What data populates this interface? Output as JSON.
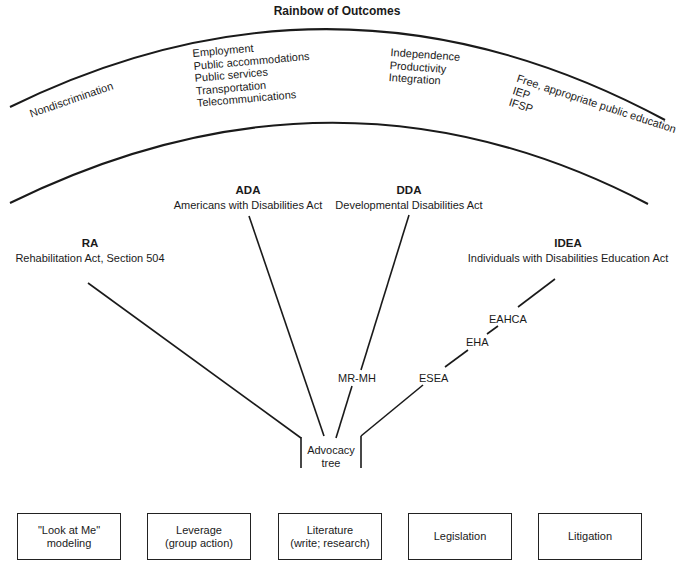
{
  "title": "Rainbow of Outcomes",
  "rainbow": {
    "segments": [
      {
        "id": "nondiscrimination",
        "lines": [
          "Nondiscrimination"
        ]
      },
      {
        "id": "ada-outcomes",
        "lines": [
          "Employment",
          "Public accommodations",
          "Public services",
          "Transportation",
          "Telecommunications"
        ]
      },
      {
        "id": "dda-outcomes",
        "lines": [
          "Independence",
          "Productivity",
          "Integration"
        ]
      },
      {
        "id": "idea-outcomes",
        "lines": [
          "Free, appropriate public education",
          "IEP",
          "IFSP"
        ]
      }
    ]
  },
  "acts": [
    {
      "abbr": "RA",
      "name": "Rehabilitation Act, Section 504"
    },
    {
      "abbr": "ADA",
      "name": "Americans with Disabilities Act"
    },
    {
      "abbr": "DDA",
      "name": "Developmental Disabilities Act"
    },
    {
      "abbr": "IDEA",
      "name": "Individuals with Disabilities Education Act"
    }
  ],
  "branch_labels": {
    "dda_precursor": "MR-MH",
    "idea_precursors": [
      "EAHCA",
      "EHA",
      "ESEA"
    ]
  },
  "trunk": {
    "lines": [
      "Advocacy",
      "tree"
    ]
  },
  "strategies": [
    {
      "lines": [
        "\"Look at Me\"",
        "modeling"
      ]
    },
    {
      "lines": [
        "Leverage",
        "(group action)"
      ]
    },
    {
      "lines": [
        "Literature",
        "(write; research)"
      ]
    },
    {
      "lines": [
        "Legislation"
      ]
    },
    {
      "lines": [
        "Litigation"
      ]
    }
  ],
  "colors": {
    "ink": "#1a1a1a",
    "background": "#ffffff"
  }
}
